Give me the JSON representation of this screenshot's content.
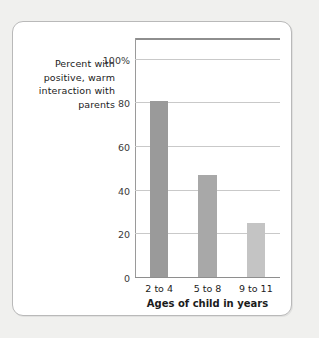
{
  "card": {
    "background_color": "#ffffff",
    "border_color": "#b9b9b9"
  },
  "chart_data": {
    "type": "bar",
    "title": "",
    "xlabel": "Ages of child in years",
    "ylabel": "Percent with positive, warm interaction with parents",
    "categories": [
      "2 to 4",
      "5 to 8",
      "9 to 11"
    ],
    "values": [
      81,
      47,
      25
    ],
    "bar_colors": [
      "#9a9a9a",
      "#a8a8a8",
      "#c4c4c4"
    ],
    "ylim": [
      0,
      110
    ],
    "yticks": [
      0,
      20,
      40,
      60,
      80,
      100
    ],
    "ytick_labels": [
      "0",
      "20",
      "40",
      "60",
      "80",
      "100%"
    ],
    "grid": true,
    "legend": "none"
  }
}
